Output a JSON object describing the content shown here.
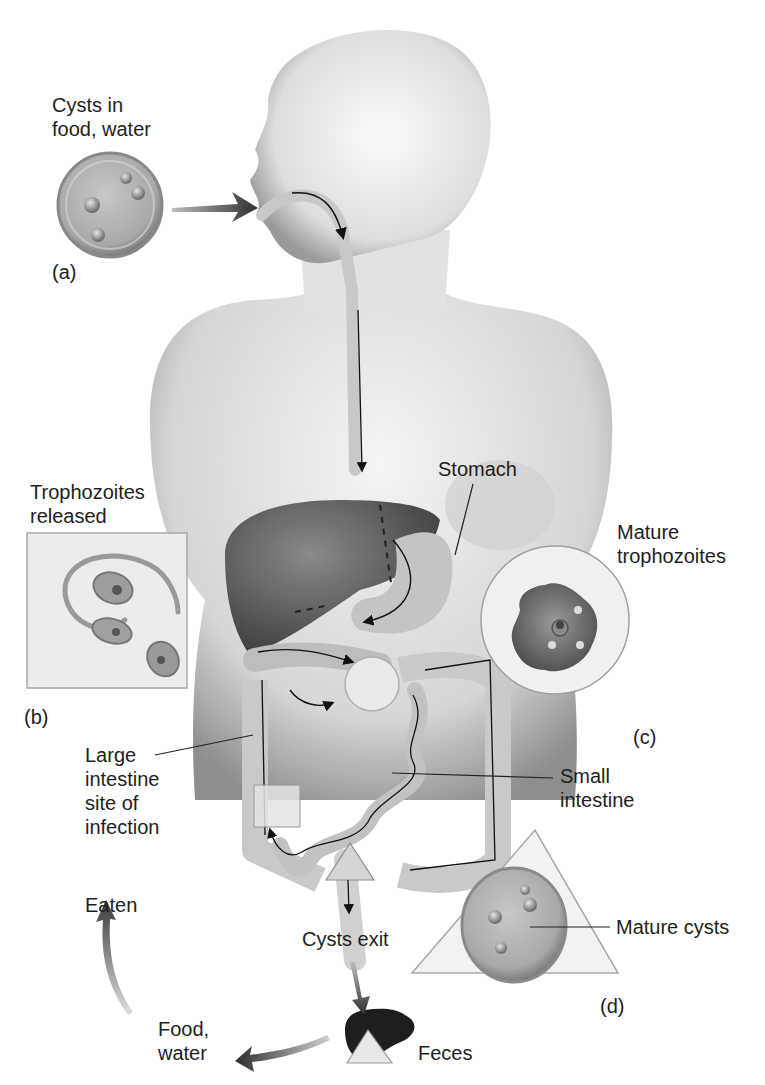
{
  "figure": {
    "colors": {
      "background": "#ffffff",
      "body_silhouette": "#d8d8d8",
      "body_shadow": "#8c8c8c",
      "organ_dark": "#5a5a5a",
      "organ_light": "#cfcfcf",
      "arrow": "#3a3a3a",
      "text": "#1e1e1e"
    }
  },
  "panels": {
    "a": {
      "tag": "(a)",
      "caption_line1": "Cysts in",
      "caption_line2": "food, water"
    },
    "b": {
      "tag": "(b)",
      "caption_line1": "Trophozoites",
      "caption_line2": "released"
    },
    "c": {
      "tag": "(c)",
      "caption_line1": "Mature",
      "caption_line2": "trophozoites"
    },
    "d": {
      "tag": "(d)",
      "caption": "Mature cysts"
    }
  },
  "labels": {
    "stomach": "Stomach",
    "large_intestine": [
      "Large",
      "intestine",
      "site of",
      "infection"
    ],
    "small_intestine": [
      "Small",
      "intestine"
    ],
    "cysts_exit": "Cysts exit",
    "feces": "Feces",
    "food_water": [
      "Food,",
      "water"
    ],
    "eaten": "Eaten"
  }
}
